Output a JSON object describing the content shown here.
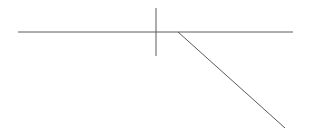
{
  "canvas": {
    "width": 310,
    "height": 134,
    "background_color": "#ffffff",
    "title": ""
  },
  "style": {
    "stroke_color": "#5a5a5a",
    "stroke_width": 1,
    "line_cap": "butt"
  },
  "figure": {
    "name": "angle-line-diagram"
  },
  "shapes": [
    {
      "id": "horizontal-baseline",
      "name": "horizontal-line",
      "type": "line",
      "x1": 18,
      "y1": 32,
      "x2": 293,
      "y2": 32,
      "color": "#5a5a5a",
      "width": 1
    },
    {
      "id": "vertical-tick",
      "name": "vertical-line",
      "type": "line",
      "x1": 156,
      "y1": 8,
      "x2": 156,
      "y2": 56,
      "color": "#5a5a5a",
      "width": 1
    },
    {
      "id": "descending-ray",
      "name": "diagonal-line",
      "type": "line",
      "x1": 178,
      "y1": 32,
      "x2": 285,
      "y2": 128,
      "color": "#5a5a5a",
      "width": 1
    }
  ],
  "labels": []
}
